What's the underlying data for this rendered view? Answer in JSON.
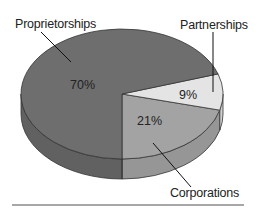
{
  "chart_data": {
    "type": "pie",
    "style": "3d",
    "title": "",
    "categories": [
      "Proprietorships",
      "Partnerships",
      "Corporations"
    ],
    "values": [
      70,
      9,
      21
    ],
    "unit": "%",
    "data_labels": [
      "70%",
      "9%",
      "21%"
    ],
    "colors": {
      "Proprietorships": "#6e6e6e",
      "Partnerships": "#e4e4e4",
      "Corporations": "#a3a3a3"
    },
    "side_colors": {
      "Proprietorships": "#616161",
      "Partnerships": "#cfcfcf",
      "Corporations": "#969696"
    },
    "legend": "callout-labels"
  }
}
